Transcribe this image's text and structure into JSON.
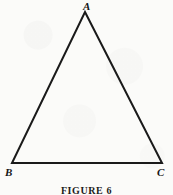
{
  "figure": {
    "caption": "FIGURE 6",
    "background_color": "#fbfbf9",
    "ink_color": "#1a1a1a",
    "stroke_width": 2,
    "canvas": {
      "width": 173,
      "height": 195
    }
  },
  "diagram": {
    "type": "triangle",
    "shape_name": "isosceles-triangle",
    "vertices": [
      {
        "id": "A",
        "label": "A",
        "x": 85,
        "y": 12,
        "label_x": 83,
        "label_y": 1
      },
      {
        "id": "B",
        "label": "B",
        "x": 12,
        "y": 163,
        "label_x": 5,
        "label_y": 167
      },
      {
        "id": "C",
        "label": "C",
        "x": 162,
        "y": 163,
        "label_x": 157,
        "label_y": 167
      }
    ],
    "edges": [
      {
        "id": "AB",
        "from": "A",
        "to": "B"
      },
      {
        "id": "AC",
        "from": "A",
        "to": "C"
      },
      {
        "id": "BC",
        "from": "B",
        "to": "C"
      }
    ],
    "polygon_points": "85,12 162,163 12,163"
  }
}
